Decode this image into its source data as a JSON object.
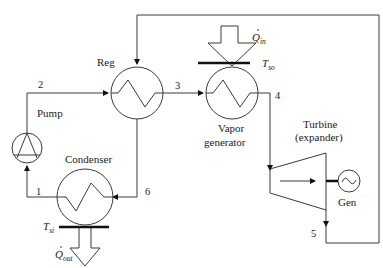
{
  "diagram": {
    "type": "Organic Rankine cycle with regenerator",
    "components": {
      "regenerator": {
        "label": "Reg"
      },
      "pump": {
        "label": "Pump"
      },
      "vapor_generator": {
        "label_line1": "Vapor",
        "label_line2": "generator"
      },
      "condenser": {
        "label": "Condenser"
      },
      "turbine": {
        "label_line1": "Turbine",
        "label_line2": "(expander)"
      },
      "generator": {
        "label": "Gen"
      }
    },
    "heat_flows": {
      "heat_in": {
        "symbol": "Q",
        "subscript": "in"
      },
      "heat_out": {
        "symbol": "Q",
        "subscript": "out"
      }
    },
    "temperatures": {
      "source": {
        "symbol": "T",
        "subscript": "so"
      },
      "sink": {
        "symbol": "T",
        "subscript": "si"
      }
    },
    "state_points": [
      "1",
      "2",
      "3",
      "4",
      "5",
      "6"
    ],
    "colors": {
      "line": "#3a3a3a",
      "bar": "#111111",
      "background": "#ffffff"
    }
  }
}
